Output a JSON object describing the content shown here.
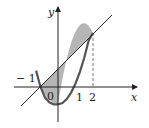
{
  "diagram": {
    "axes": {
      "x_label": "x",
      "y_label": "y"
    },
    "tick_labels": {
      "neg_one": "− 1",
      "zero": "0",
      "one": "1",
      "two": "2"
    },
    "curves": [
      {
        "name": "parabola",
        "equation": "y = x^2 - 1"
      },
      {
        "name": "line",
        "equation": "y = x + 1"
      }
    ],
    "shaded_region": {
      "from_x": -1,
      "to_x": 2
    },
    "colors": {
      "shade": "#b5b5b5",
      "curve": "#555555",
      "axis": "#222222"
    }
  }
}
